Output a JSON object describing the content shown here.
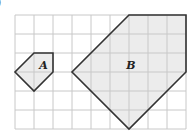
{
  "figure_label": ")",
  "grid": {
    "cols": 9,
    "rows": 6,
    "origin_x": 15,
    "origin_y": 15,
    "cell": 19,
    "line_color": "#c8c8c8"
  },
  "shapes": [
    {
      "name": "A",
      "label": "A",
      "points": [
        [
          1,
          2
        ],
        [
          2,
          2
        ],
        [
          2,
          3
        ],
        [
          1,
          4
        ],
        [
          0,
          3
        ]
      ],
      "fill": "#ececec",
      "stroke": "#333333",
      "label_pos": [
        1.5,
        2.85
      ]
    },
    {
      "name": "B",
      "label": "B",
      "points": [
        [
          6,
          0
        ],
        [
          9,
          0
        ],
        [
          9,
          3
        ],
        [
          6,
          6
        ],
        [
          3,
          3
        ]
      ],
      "fill": "#ececec",
      "stroke": "#333333",
      "label_pos": [
        6.1,
        2.85
      ]
    }
  ]
}
